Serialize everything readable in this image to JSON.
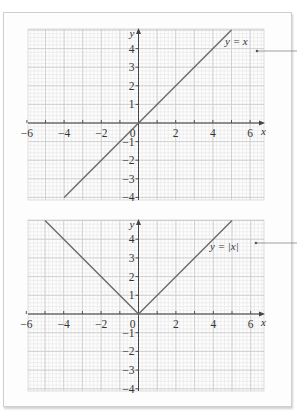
{
  "chart_data": [
    {
      "type": "line",
      "title": "y = x",
      "label": "y = x",
      "xlabel": "x",
      "ylabel": "y",
      "xlim": [
        -6,
        7
      ],
      "ylim": [
        -4,
        5
      ],
      "x_ticks": [
        -6,
        -4,
        -2,
        0,
        2,
        4,
        6
      ],
      "x_tick_labels": [
        "−6",
        "−4",
        "−2",
        "0",
        "2",
        "4",
        "6"
      ],
      "y_ticks": [
        -4,
        -3,
        -2,
        -1,
        1,
        2,
        3,
        4
      ],
      "y_tick_labels": [
        "−4",
        "−3",
        "−2",
        "−1",
        "1",
        "2",
        "3",
        "4"
      ],
      "grid": true,
      "series": [
        {
          "name": "y = x",
          "x": [
            -4,
            5
          ],
          "y": [
            -4,
            5
          ]
        }
      ],
      "annotation": {
        "text": "y = x",
        "callout": true
      }
    },
    {
      "type": "line",
      "title": "y = |x|",
      "label": "y = |x|",
      "xlabel": "x",
      "ylabel": "y",
      "xlim": [
        -6,
        7
      ],
      "ylim": [
        -4,
        5
      ],
      "x_ticks": [
        -6,
        -4,
        -2,
        0,
        2,
        4,
        6
      ],
      "x_tick_labels": [
        "−6",
        "−4",
        "−2",
        "0",
        "2",
        "4",
        "6"
      ],
      "y_ticks": [
        -4,
        -3,
        -2,
        -1,
        1,
        2,
        3,
        4
      ],
      "y_tick_labels": [
        "−4",
        "−3",
        "−2",
        "−1",
        "1",
        "2",
        "3",
        "4"
      ],
      "grid": true,
      "series": [
        {
          "name": "y = |x|",
          "x": [
            -5,
            0,
            5
          ],
          "y": [
            5,
            0,
            5
          ]
        }
      ],
      "annotation": {
        "text": "y = |x|",
        "callout": true
      }
    }
  ],
  "colors": {
    "line": "#6a6a6a",
    "axis": "#444444",
    "grid_minor": "#e6e6e6",
    "grid_major": "#c9c9c9",
    "panel_border": "#cfcfcf"
  }
}
